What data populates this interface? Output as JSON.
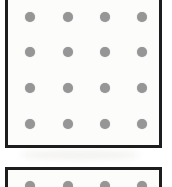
{
  "figure": {
    "background_color": "#ffffff",
    "paper_color": "#fcfcfa",
    "border_color": "#1d1d1d",
    "dot_color": "#969696",
    "dot_diameter_px": 10,
    "canvas": {
      "width": 172,
      "height": 187
    }
  },
  "panels": [
    {
      "id": "panel-top",
      "label": "Upper dot grid panel",
      "x": 5,
      "y": -6,
      "width": 157,
      "height": 154,
      "clipped_edges": [
        "top"
      ],
      "grid": {
        "rows": 4,
        "cols": 4,
        "col_centers": [
          30,
          68,
          105,
          142
        ],
        "row_centers": [
          17,
          52,
          88,
          124
        ]
      }
    },
    {
      "id": "panel-bottom",
      "label": "Lower dot grid panel (clipped)",
      "x": 5,
      "y": 167,
      "width": 157,
      "height": 40,
      "clipped_edges": [
        "bottom"
      ],
      "grid": {
        "rows": 1,
        "cols": 4,
        "col_centers": [
          30,
          68,
          105,
          142
        ],
        "row_centers": [
          186
        ]
      }
    }
  ],
  "smudges": [
    {
      "x": 46,
      "y": 57,
      "width": 60,
      "height": 22
    },
    {
      "x": 88,
      "y": 60,
      "width": 34,
      "height": 16
    },
    {
      "x": 38,
      "y": 92,
      "width": 44,
      "height": 14
    },
    {
      "x": 96,
      "y": 98,
      "width": 40,
      "height": 14
    },
    {
      "x": 20,
      "y": 150,
      "width": 120,
      "height": 10
    }
  ]
}
